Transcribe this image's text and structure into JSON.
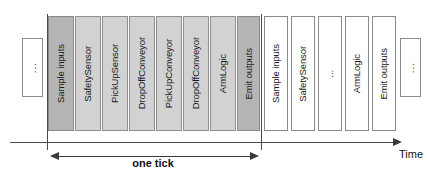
{
  "diagram": {
    "colors": {
      "fill_dark": "#b5b5b5",
      "fill_medium": "#d2d2d2",
      "fill_none": "#ffffff",
      "stroke": "#7a7a7a",
      "axis": "#4a4a4a"
    },
    "left_ellipsis": {
      "label": "..."
    },
    "right_ellipsis": {
      "label": "..."
    },
    "tick_groups": [
      {
        "name": "current-tick",
        "steps": [
          {
            "label": "Sample inputs",
            "fill": "dark"
          },
          {
            "label": "SafetySensor",
            "fill": "medium"
          },
          {
            "label": "PickUpSensor",
            "fill": "medium"
          },
          {
            "label": "DropOffConveyor",
            "fill": "medium"
          },
          {
            "label": "PickUpConveyor",
            "fill": "medium"
          },
          {
            "label": "DropOffConveyor",
            "fill": "medium"
          },
          {
            "label": "ArmLogic",
            "fill": "medium"
          },
          {
            "label": "Emit outputs",
            "fill": "dark"
          }
        ]
      },
      {
        "name": "next-tick",
        "steps": [
          {
            "label": "Sample inputs",
            "fill": "none"
          },
          {
            "label": "SafetySensor",
            "fill": "none"
          },
          {
            "label": "...",
            "fill": "none"
          },
          {
            "label": "ArmLogic",
            "fill": "none"
          },
          {
            "label": "Emit outputs",
            "fill": "none"
          }
        ]
      }
    ],
    "axis": {
      "time_label": "Time",
      "tick_span_label": "one tick"
    }
  }
}
